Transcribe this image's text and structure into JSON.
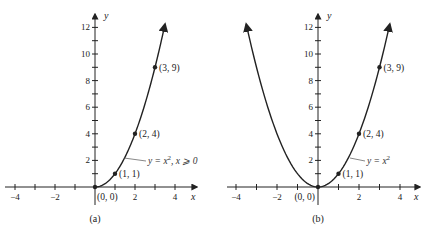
{
  "chart_data": [
    {
      "type": "line",
      "panel": "a",
      "caption": "(a)",
      "function_label": "y = x², x ⩾ 0",
      "function_parts": {
        "lhs": "y = x",
        "exp": "2",
        "rest": ", x ⩾ 0"
      },
      "xlabel": "x",
      "ylabel": "y",
      "xlim": [
        -4.5,
        4.5
      ],
      "ylim": [
        0,
        13
      ],
      "x_ticks": [
        -4,
        -3,
        -2,
        -1,
        1,
        2,
        3,
        4
      ],
      "x_tick_labels": [
        {
          "v": -4,
          "t": "−4"
        },
        {
          "v": -2,
          "t": "−2"
        },
        {
          "v": 2,
          "t": "2"
        },
        {
          "v": 4,
          "t": "4"
        }
      ],
      "y_ticks": [
        1,
        2,
        3,
        4,
        5,
        6,
        7,
        8,
        9,
        10,
        11,
        12
      ],
      "y_tick_labels": [
        {
          "v": 2,
          "t": "2"
        },
        {
          "v": 4,
          "t": "4"
        },
        {
          "v": 6,
          "t": "6"
        },
        {
          "v": 8,
          "t": "8"
        },
        {
          "v": 10,
          "t": "10"
        },
        {
          "v": 12,
          "t": "12"
        }
      ],
      "domain": [
        0,
        3.5
      ],
      "points": [
        {
          "x": 0,
          "y": 0,
          "label": "(0, 0)"
        },
        {
          "x": 1,
          "y": 1,
          "label": "(1, 1)"
        },
        {
          "x": 2,
          "y": 4,
          "label": "(2, 4)"
        },
        {
          "x": 3,
          "y": 9,
          "label": "(3, 9)"
        }
      ],
      "grid": false
    },
    {
      "type": "line",
      "panel": "b",
      "caption": "(b)",
      "function_label": "y = x²",
      "function_parts": {
        "lhs": "y = x",
        "exp": "2",
        "rest": ""
      },
      "xlabel": "x",
      "ylabel": "y",
      "xlim": [
        -4.5,
        4.5
      ],
      "ylim": [
        0,
        13
      ],
      "x_ticks": [
        -4,
        -3,
        -2,
        -1,
        1,
        2,
        3,
        4
      ],
      "x_tick_labels": [
        {
          "v": -4,
          "t": "−4"
        },
        {
          "v": -2,
          "t": "−2"
        },
        {
          "v": 2,
          "t": "2"
        },
        {
          "v": 4,
          "t": "4"
        }
      ],
      "y_ticks": [
        1,
        2,
        3,
        4,
        5,
        6,
        7,
        8,
        9,
        10,
        11,
        12
      ],
      "y_tick_labels": [
        {
          "v": 2,
          "t": "2"
        },
        {
          "v": 4,
          "t": "4"
        },
        {
          "v": 6,
          "t": "6"
        },
        {
          "v": 8,
          "t": "8"
        },
        {
          "v": 10,
          "t": "10"
        },
        {
          "v": 12,
          "t": "12"
        }
      ],
      "domain": [
        -3.5,
        3.5
      ],
      "points": [
        {
          "x": 0,
          "y": 0,
          "label": "(0, 0)"
        },
        {
          "x": 1,
          "y": 1,
          "label": "(1, 1)"
        },
        {
          "x": 2,
          "y": 4,
          "label": "(2, 4)"
        },
        {
          "x": 3,
          "y": 9,
          "label": "(3, 9)"
        }
      ],
      "grid": false
    }
  ],
  "layout": {
    "panels": [
      {
        "ox": 95,
        "oy": 187,
        "sx": 20,
        "sy": 13.3,
        "axis_left": 5,
        "axis_right": 197,
        "axis_top": 14,
        "axis_bottom": 205,
        "label_x_pos": [
          191,
          200
        ],
        "label_y_pos": [
          104,
          19
        ],
        "eq_pos": [
          148,
          164
        ],
        "leader": [
          [
            146,
            161
          ],
          [
            124,
            158
          ]
        ],
        "caption_pos": [
          95,
          222
        ],
        "origin_label_pos": [
          97,
          200
        ],
        "origin_label_anchor": "start"
      },
      {
        "ox": 318,
        "oy": 187,
        "sx": 20.5,
        "sy": 13.3,
        "axis_left": 227,
        "axis_right": 420,
        "axis_top": 14,
        "axis_bottom": 205,
        "label_x_pos": [
          414,
          200
        ],
        "label_y_pos": [
          327,
          19
        ],
        "eq_pos": [
          367,
          164
        ],
        "leader": [
          [
            365,
            161
          ],
          [
            350,
            158
          ]
        ],
        "caption_pos": [
          318,
          222
        ],
        "origin_label_pos": [
          315,
          200
        ],
        "origin_label_anchor": "end"
      }
    ],
    "ink": "#222222"
  }
}
